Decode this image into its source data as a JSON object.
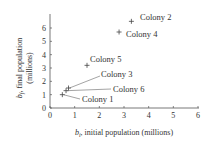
{
  "chart_data": {
    "type": "scatter",
    "title": "",
    "xlabel": "b_i, initial population (millions)",
    "ylabel": "b_f, final population (millions)",
    "xlim": [
      0,
      6
    ],
    "ylim": [
      0,
      6.5
    ],
    "xticks": [
      0,
      1,
      2,
      3,
      4,
      5,
      6
    ],
    "yticks": [
      0,
      1,
      2,
      3,
      4,
      5,
      6
    ],
    "grid": false,
    "points": [
      {
        "label": "Colony 1",
        "x": 0.5,
        "y": 1.0
      },
      {
        "label": "Colony 2",
        "x": 3.3,
        "y": 6.5
      },
      {
        "label": "Colony 3",
        "x": 0.75,
        "y": 1.5
      },
      {
        "label": "Colony 4",
        "x": 2.8,
        "y": 5.7
      },
      {
        "label": "Colony 5",
        "x": 1.5,
        "y": 3.2
      },
      {
        "label": "Colony 6",
        "x": 0.65,
        "y": 1.3
      }
    ]
  },
  "labels": {
    "xlabel_var": "b",
    "xlabel_sub": "i",
    "xlabel_rest": ", initial population (millions)",
    "ylabel_var": "b",
    "ylabel_sub": "f",
    "ylabel_rest1": ", final population",
    "ylabel_rest2": "(millions)"
  }
}
